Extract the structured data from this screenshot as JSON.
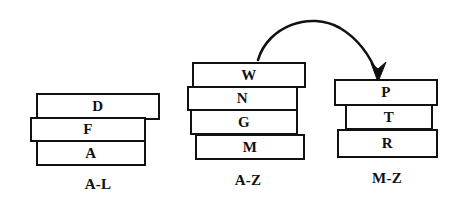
{
  "diagram": {
    "background_color": "#ffffff",
    "ink_color": "#111111",
    "stacks": [
      {
        "id": "a-l",
        "caption": "A-L",
        "caption_x": 63,
        "caption_y": 176,
        "caption_width": 70,
        "boxes": [
          {
            "label": "D",
            "x": 36,
            "y": 93,
            "w": 124,
            "h": 27
          },
          {
            "label": "F",
            "x": 30,
            "y": 117,
            "w": 116,
            "h": 25
          },
          {
            "label": "A",
            "x": 36,
            "y": 140,
            "w": 110,
            "h": 26
          }
        ]
      },
      {
        "id": "a-z",
        "caption": "A-Z",
        "caption_x": 213,
        "caption_y": 172,
        "caption_width": 70,
        "boxes": [
          {
            "label": "W",
            "x": 192,
            "y": 62,
            "w": 114,
            "h": 26
          },
          {
            "label": "N",
            "x": 187,
            "y": 86,
            "w": 111,
            "h": 25
          },
          {
            "label": "G",
            "x": 190,
            "y": 109,
            "w": 108,
            "h": 26
          },
          {
            "label": "M",
            "x": 195,
            "y": 134,
            "w": 110,
            "h": 26
          }
        ]
      },
      {
        "id": "m-z",
        "caption": "M-Z",
        "caption_x": 351,
        "caption_y": 170,
        "caption_width": 72,
        "boxes": [
          {
            "label": "P",
            "x": 334,
            "y": 79,
            "w": 104,
            "h": 27
          },
          {
            "label": "T",
            "x": 345,
            "y": 104,
            "w": 88,
            "h": 26
          },
          {
            "label": "R",
            "x": 337,
            "y": 129,
            "w": 101,
            "h": 29
          }
        ]
      }
    ],
    "arrow": {
      "name": "move-arrow",
      "from_stack": "a-z",
      "to_stack": "m-z",
      "path": "M 258 60 C 268 26, 310 11, 340 28 C 360 40, 372 60, 378 76",
      "head_points": "378,82 371,63 378,69 386,62",
      "stroke_width": 2.6
    }
  }
}
